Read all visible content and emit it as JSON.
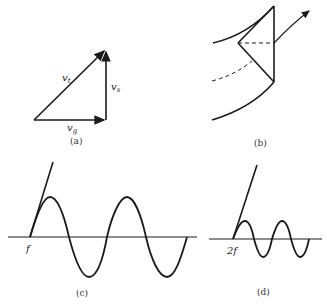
{
  "panels": {
    "a": {
      "caption": "(a)",
      "labels": {
        "vt": "v",
        "vt_sub": "t",
        "vs": "v",
        "vs_sub": "s",
        "vg": "v",
        "vg_sub": "g"
      }
    },
    "b": {
      "caption": "(b)"
    },
    "c": {
      "caption": "(c)",
      "axis_label": "f"
    },
    "d": {
      "caption": "(d)",
      "axis_label": "2f"
    }
  },
  "colors": {
    "stroke": "#1a1a1a",
    "background": "#ffffff"
  }
}
